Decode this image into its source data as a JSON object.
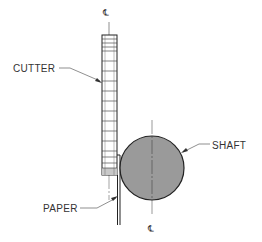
{
  "diagram": {
    "labels": {
      "cutter": "CUTTER",
      "shaft": "SHAFT",
      "paper": "PAPER"
    },
    "centerline_symbol": "℄",
    "centerline_top_label": "℄",
    "centerline_bottom_label": "℄",
    "colors": {
      "line": "#222222",
      "shaft_fill": "#9a9a9a",
      "cutter_bottom_fill": "#c8c8c8",
      "text": "#333333"
    }
  }
}
